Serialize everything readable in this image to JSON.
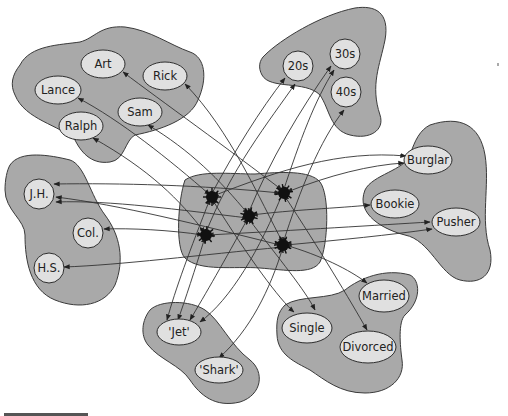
{
  "diagram": {
    "pools": [
      {
        "name": "names",
        "units": [
          "Art",
          "Rick",
          "Lance",
          "Sam",
          "Ralph"
        ]
      },
      {
        "name": "age",
        "units": [
          "20s",
          "30s",
          "40s"
        ]
      },
      {
        "name": "occupation",
        "units": [
          "Burglar",
          "Bookie",
          "Pusher"
        ]
      },
      {
        "name": "education",
        "units": [
          "J.H.",
          "Col.",
          "H.S."
        ]
      },
      {
        "name": "gang",
        "units": [
          "'Jet'",
          "'Shark'"
        ]
      },
      {
        "name": "marital-status",
        "units": [
          "Single",
          "Married",
          "Divorced"
        ]
      },
      {
        "name": "instances",
        "units": [
          "",
          "",
          "",
          "",
          ""
        ]
      }
    ],
    "labels": {
      "art": "Art",
      "rick": "Rick",
      "lance": "Lance",
      "sam": "Sam",
      "ralph": "Ralph",
      "age20": "20s",
      "age30": "30s",
      "age40": "40s",
      "burglar": "Burglar",
      "bookie": "Bookie",
      "pusher": "Pusher",
      "jh": "J.H.",
      "col": "Col.",
      "hs": "H.S.",
      "jet": "'Jet'",
      "shark": "'Shark'",
      "single": "Single",
      "married": "Married",
      "divorced": "Divorced"
    },
    "colors": {
      "pool_fill": "#a9a9a9",
      "unit_fill": "#e0e0e0",
      "hub_fill": "#111111",
      "line": "#333333"
    }
  }
}
